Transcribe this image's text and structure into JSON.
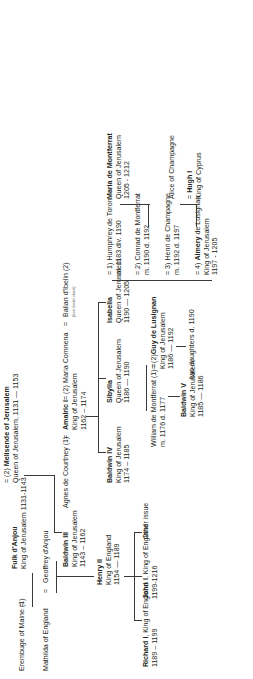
{
  "chart": {
    "type": "family-tree"
  },
  "people": {
    "erembuge": {
      "name": "Erembuge of Maine (1)"
    },
    "fulk": {
      "name": "Fulk d'Anjou",
      "titles": "King of Jerusalem 1131-1143"
    },
    "melisende": {
      "name": "Melisende of Jerusalem",
      "prefix": "= (2)",
      "titles": "Queen of Jerusalem, 1131 — 1153"
    },
    "mathilda": {
      "name": "Mathilda of England"
    },
    "geoffrey": {
      "name": "Geoffrey d'Anjou"
    },
    "baldwin3": {
      "name": "Baldwin III",
      "titles": "King of Jerusalem",
      "dates": "1143 – 1162"
    },
    "agnes": {
      "name": "Agnes de Courtney (1)"
    },
    "amalric": {
      "name": "Amalric I",
      "prefix": "=",
      "suffix": "= (2)",
      "titles": "King of Jerusalem",
      "dates": "1162 – 1174"
    },
    "maria_comnena": {
      "name": "Maria Comnena",
      "suffix": "="
    },
    "balian": {
      "name": "Balian d'Ibelin (2)",
      "note": "(see Ibelin chart)"
    },
    "henry2": {
      "name": "Henry II",
      "titles": "King of England",
      "dates": "1154 — 1189"
    },
    "baldwin4": {
      "name": "Baldwin IV",
      "titles": "King of Jerusalem",
      "dates": "1174 – 1185"
    },
    "sibylla": {
      "name": "Sibylla",
      "titles": "Queen of Jerusalem",
      "dates": "1186 — 1190"
    },
    "isabella": {
      "name": "Isabella",
      "titles": "Queen of Jerusalem",
      "dates": "1190 — 1205"
    },
    "richard1": {
      "name": "Richard I",
      "titles": ", King of England",
      "dates": "1189 – 1199"
    },
    "john1": {
      "name": "John I",
      "titles": ", King of England",
      "dates": "1199-1216"
    },
    "other_issue": {
      "name": "Other issue"
    },
    "william_montferrat": {
      "name": "William de Montferrat (1) =",
      "dates": "m. 1176    d. 1177"
    },
    "guy": {
      "name": "Guy de Lusignan",
      "prefix": "= (2)",
      "titles": "King of Jerusalem",
      "dates": "1186 — 1192"
    },
    "baldwin5": {
      "name": "Baldwin V",
      "titles": "King of Jerusalem",
      "dates": "1185 — 1186"
    },
    "two_daughters": {
      "name": "two daughters d. 1190"
    },
    "humphrey": {
      "name": "Humphrey de Toron",
      "prefix": "= 1)",
      "dates": "m. 1183    div. 1190"
    },
    "conrad": {
      "name": "Conrad de Montferrat",
      "prefix": "= 2)",
      "dates": "m. 1190    d. 1192"
    },
    "henri_champagne": {
      "name": "Henri de Champagne",
      "prefix": "= 3)",
      "dates": "m. 1192  d. 1197"
    },
    "aimery": {
      "name": "Aimery",
      "prefix": "= 4)",
      "titles": "de Lusignan",
      "titles2": "King of Jerusalem",
      "dates": "1197 - 1205"
    },
    "maria_montferrat": {
      "name": "Maria de Montferrat",
      "titles": "Queen of Jerusalem",
      "dates": "1205 - 1212"
    },
    "alice": {
      "name": "Alice of Champagne"
    },
    "hugh1": {
      "name": "Hugh I",
      "prefix": "=",
      "titles": "King of Cyprus"
    }
  }
}
